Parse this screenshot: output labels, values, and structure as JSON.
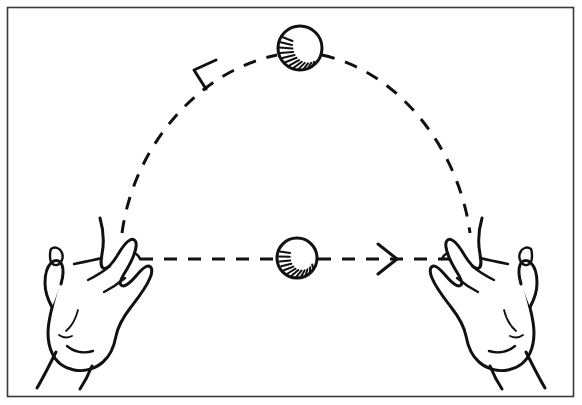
{
  "figure": {
    "alt_text": "Line drawing of two open hands; a dashed arc with a leftward arrow shows a ball thrown up and over, and a dashed straight line with a rightward arrow shows a ball passed across.",
    "width": 582,
    "height": 405,
    "background_color": "#ffffff",
    "ink_color": "#111111",
    "frame": {
      "name": "outer-border",
      "color": "#3a3a3a",
      "stroke_width": 1.6,
      "x": 7,
      "y": 7,
      "width": 567,
      "height": 390
    }
  },
  "elements": {
    "arc_path": {
      "label": "dashed arc trajectory",
      "style": "dashed",
      "dash_pattern": "13 11",
      "stroke_width": 3,
      "start": [
        122,
        232
      ],
      "apex": [
        296,
        52
      ],
      "end": [
        470,
        232
      ],
      "direction": "right-to-left"
    },
    "arc_arrow": {
      "label": "arrowhead pointing up-left along arc",
      "direction": "up-left",
      "tip": [
        196,
        68
      ],
      "style": "open-v"
    },
    "straight_path": {
      "label": "dashed horizontal pass line",
      "style": "dashed",
      "dash_pattern": "13 11",
      "stroke_width": 3,
      "start": [
        140,
        259
      ],
      "end": [
        456,
        259
      ],
      "direction": "left-to-right"
    },
    "straight_arrow": {
      "label": "arrowhead pointing right",
      "direction": "right",
      "tip": [
        397,
        259
      ],
      "style": "open-v"
    },
    "ball_top": {
      "label": "ball at apex of arc",
      "center": [
        300,
        48
      ],
      "radius": 22,
      "hatching": "lower-left"
    },
    "ball_center": {
      "label": "ball on straight pass line",
      "center": [
        297,
        258
      ],
      "radius": 20,
      "hatching": "bottom"
    },
    "hand_left": {
      "label": "left open hand, palm up, fingers angled up-right",
      "position": "lower-left",
      "bbox": [
        28,
        208,
        150,
        385
      ]
    },
    "hand_right": {
      "label": "right open hand, palm up, fingers angled up-left",
      "position": "lower-right",
      "bbox": [
        450,
        208,
        562,
        385
      ]
    }
  }
}
